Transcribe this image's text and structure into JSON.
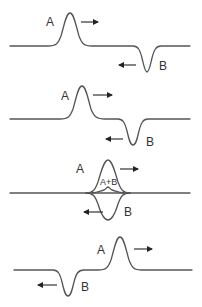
{
  "diagram": {
    "colors": {
      "wave": "#555555",
      "arrow": "#222222",
      "text": "#333333",
      "background": "#ffffff"
    },
    "panels": [
      {
        "id": 1,
        "description": "Pulses approaching",
        "labels": {
          "a": "A",
          "b": "B"
        },
        "arrows": {
          "a": "right",
          "b": "left"
        }
      },
      {
        "id": 2,
        "description": "Pulses closer together",
        "labels": {
          "a": "A",
          "b": "B"
        },
        "arrows": {
          "a": "right",
          "b": "left"
        }
      },
      {
        "id": 3,
        "description": "Pulses overlapping — resultant A+B",
        "labels": {
          "a": "A",
          "b": "B",
          "sum": "A+B"
        },
        "arrows": {
          "a": "right",
          "b": "left"
        }
      },
      {
        "id": 4,
        "description": "Pulses have passed through each other",
        "labels": {
          "a": "A",
          "b": "B"
        },
        "arrows": {
          "a": "right",
          "b": "left"
        }
      }
    ]
  }
}
